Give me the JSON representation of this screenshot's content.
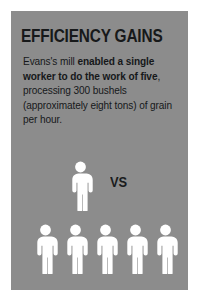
{
  "card": {
    "background_color": "#8c8c8c",
    "page_background_color": "#ffffff"
  },
  "headline": {
    "text": "EFFICIENCY GAINS",
    "color": "#17191a"
  },
  "body": {
    "color": "#16181a",
    "runs": [
      {
        "text": "Evans's mill ",
        "bold": false
      },
      {
        "text": "enabled a single worker to do the work of five",
        "bold": true
      },
      {
        "text": ", processing 300 bushels (approximately eight tons) of grain per hour.",
        "bold": false
      }
    ],
    "full_text": "Evans's mill enabled a single worker to do the work of five, processing 300 bushels (approximately eight tons) of grain per hour."
  },
  "comparison": {
    "vs_label": "VS",
    "vs_color": "#1a1c1d",
    "figure_color": "#ffffff",
    "before": {
      "icon": "person-icon",
      "count": 1,
      "figures": [
        {
          "icon": "person-icon",
          "index": 1
        }
      ]
    },
    "after": {
      "icon": "person-icon",
      "count": 5,
      "figures": [
        {
          "icon": "person-icon",
          "index": 1
        },
        {
          "icon": "person-icon",
          "index": 2
        },
        {
          "icon": "person-icon",
          "index": 3
        },
        {
          "icon": "person-icon",
          "index": 4
        },
        {
          "icon": "person-icon",
          "index": 5
        }
      ]
    }
  }
}
